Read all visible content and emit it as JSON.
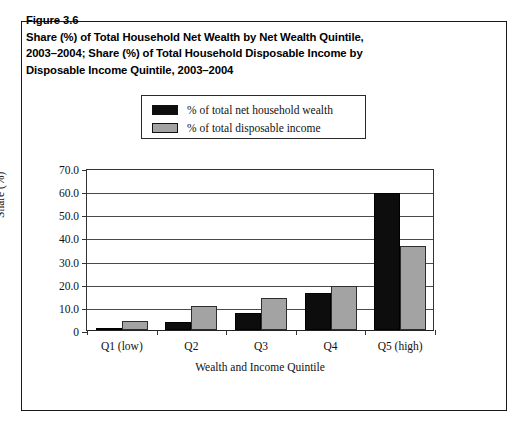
{
  "figure": {
    "number": "Figure 3.6",
    "title_lines": [
      "Share (%) of Total Household Net Wealth by Net Wealth Quintile,",
      "2003–2004; Share (%) of Total Household Disposable Income by",
      "Disposable Income Quintile, 2003–2004"
    ]
  },
  "legend": {
    "position": "top-center-inside",
    "entries": [
      {
        "label": "% of total net household wealth",
        "color": "#0d0d0d"
      },
      {
        "label": "% of total disposable income",
        "color": "#a3a3a3"
      }
    ]
  },
  "chart_data": {
    "type": "bar",
    "title": "Share (%) of Total Household Net Wealth by Net Wealth Quintile, 2003–2004; Share (%) of Total Household Disposable Income by Disposable Income Quintile, 2003–2004",
    "xlabel": "Wealth and Income Quintile",
    "ylabel": "Share (%)",
    "categories": [
      "Q1 (low)",
      "Q2",
      "Q3",
      "Q4",
      "Q5 (high)"
    ],
    "series": [
      {
        "name": "% of total net household wealth",
        "color": "#0d0d0d",
        "values": [
          1.0,
          3.5,
          7.5,
          16.0,
          59.0
        ]
      },
      {
        "name": "% of total disposable income",
        "color": "#a3a3a3",
        "values": [
          4.0,
          10.5,
          14.0,
          19.0,
          36.5
        ]
      }
    ],
    "ylim": [
      0,
      70
    ],
    "ytick_values": [
      70,
      60,
      50,
      40,
      30,
      20,
      10,
      0
    ],
    "ytick_labels": [
      "70.0",
      "60.0",
      "50.0",
      "40.0",
      "30.0",
      "20.0",
      "10.0",
      "0"
    ],
    "grid": true,
    "grid_axis": "y",
    "legend_position": "top-center"
  }
}
